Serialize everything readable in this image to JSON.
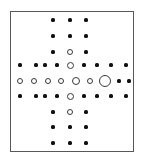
{
  "figure": {
    "title": "",
    "frame": {
      "x": 10,
      "y": 11,
      "width": 124,
      "height": 141,
      "border_color": "#555a5e"
    },
    "background_color": "#ffffff",
    "filled_marker_color": "#111111",
    "open_marker_edge_color": "#3a3a3a",
    "open_marker_fill_color": "#ffffff"
  },
  "chart_data": {
    "type": "scatter",
    "title": "",
    "xlabel": "",
    "ylabel": "",
    "grid": false,
    "legend": null,
    "axis_ticks_visible": false,
    "column_x": [
      20,
      36,
      53,
      70,
      86,
      98,
      114,
      128,
      128
    ],
    "grid_geometry": {
      "columns": 9,
      "rows": 9,
      "col_spacing_px": 16.5,
      "row_spacing_px": 16.0,
      "origin_x_px": 20,
      "origin_y_px": 20
    },
    "marker_sizes_px": {
      "filled_dot": 3.2,
      "open_small": 5.0,
      "open_medium": 7.0,
      "open_large": 8.0,
      "open_xlarge": 12.0
    },
    "points": [
      {
        "col": 3,
        "row": 0,
        "cx": 53,
        "cy": 20,
        "style": "filled",
        "d": 3.2
      },
      {
        "col": 4,
        "row": 0,
        "cx": 70,
        "cy": 20,
        "style": "filled",
        "d": 3.2
      },
      {
        "col": 5,
        "row": 0,
        "cx": 86,
        "cy": 20,
        "style": "filled",
        "d": 3.2
      },
      {
        "col": 3,
        "row": 1,
        "cx": 53,
        "cy": 36,
        "style": "filled",
        "d": 3.2
      },
      {
        "col": 4,
        "row": 1,
        "cx": 70,
        "cy": 36,
        "style": "filled",
        "d": 3.2
      },
      {
        "col": 5,
        "row": 1,
        "cx": 86,
        "cy": 36,
        "style": "filled",
        "d": 3.2
      },
      {
        "col": 3,
        "row": 2,
        "cx": 53,
        "cy": 52,
        "style": "filled",
        "d": 3.2
      },
      {
        "col": 4,
        "row": 2,
        "cx": 70,
        "cy": 52,
        "style": "open",
        "d": 6.0
      },
      {
        "col": 5,
        "row": 2,
        "cx": 86,
        "cy": 52,
        "style": "filled",
        "d": 3.2
      },
      {
        "col": 0,
        "row": 3,
        "cx": 20,
        "cy": 65,
        "style": "filled",
        "d": 3.2
      },
      {
        "col": 1,
        "row": 3,
        "cx": 36,
        "cy": 65,
        "style": "filled",
        "d": 3.2
      },
      {
        "col": 2,
        "row": 3,
        "cx": 45,
        "cy": 65,
        "style": "filled",
        "d": 3.2
      },
      {
        "col": 3,
        "row": 3,
        "cx": 57,
        "cy": 65,
        "style": "filled",
        "d": 3.2
      },
      {
        "col": 4,
        "row": 3,
        "cx": 70,
        "cy": 65,
        "style": "open",
        "d": 7.0
      },
      {
        "col": 5,
        "row": 3,
        "cx": 84,
        "cy": 65,
        "style": "filled",
        "d": 3.2
      },
      {
        "col": 6,
        "row": 3,
        "cx": 97,
        "cy": 65,
        "style": "filled",
        "d": 3.2
      },
      {
        "col": 7,
        "row": 3,
        "cx": 111,
        "cy": 65,
        "style": "filled",
        "d": 3.2
      },
      {
        "col": 8,
        "row": 3,
        "cx": 126,
        "cy": 65,
        "style": "filled",
        "d": 3.2
      },
      {
        "col": 0,
        "row": 4,
        "cx": 20,
        "cy": 81,
        "style": "open",
        "d": 6.0
      },
      {
        "col": 1,
        "row": 4,
        "cx": 34,
        "cy": 81,
        "style": "open",
        "d": 6.0
      },
      {
        "col": 2,
        "row": 4,
        "cx": 48,
        "cy": 81,
        "style": "open",
        "d": 6.0
      },
      {
        "col": 3,
        "row": 4,
        "cx": 61,
        "cy": 81,
        "style": "open",
        "d": 6.0
      },
      {
        "col": 4,
        "row": 4,
        "cx": 76,
        "cy": 81,
        "style": "open",
        "d": 8.0
      },
      {
        "col": 5,
        "row": 4,
        "cx": 90,
        "cy": 81,
        "style": "open",
        "d": 6.0
      },
      {
        "col": 6,
        "row": 4,
        "cx": 105,
        "cy": 81,
        "style": "open",
        "d": 12.0
      },
      {
        "col": 7,
        "row": 4,
        "cx": 119,
        "cy": 81,
        "style": "filled",
        "d": 3.2
      },
      {
        "col": 8,
        "row": 4,
        "cx": 129,
        "cy": 81,
        "style": "filled",
        "d": 3.2
      },
      {
        "col": 0,
        "row": 5,
        "cx": 20,
        "cy": 96,
        "style": "filled",
        "d": 3.2
      },
      {
        "col": 1,
        "row": 5,
        "cx": 36,
        "cy": 96,
        "style": "filled",
        "d": 3.2
      },
      {
        "col": 2,
        "row": 5,
        "cx": 45,
        "cy": 96,
        "style": "filled",
        "d": 3.2
      },
      {
        "col": 3,
        "row": 5,
        "cx": 57,
        "cy": 96,
        "style": "filled",
        "d": 3.2
      },
      {
        "col": 4,
        "row": 5,
        "cx": 70,
        "cy": 96,
        "style": "open",
        "d": 7.0
      },
      {
        "col": 5,
        "row": 5,
        "cx": 84,
        "cy": 96,
        "style": "filled",
        "d": 3.2
      },
      {
        "col": 6,
        "row": 5,
        "cx": 97,
        "cy": 96,
        "style": "filled",
        "d": 3.2
      },
      {
        "col": 7,
        "row": 5,
        "cx": 111,
        "cy": 96,
        "style": "filled",
        "d": 3.2
      },
      {
        "col": 8,
        "row": 5,
        "cx": 126,
        "cy": 96,
        "style": "filled",
        "d": 3.2
      },
      {
        "col": 3,
        "row": 6,
        "cx": 53,
        "cy": 112,
        "style": "filled",
        "d": 3.2
      },
      {
        "col": 4,
        "row": 6,
        "cx": 70,
        "cy": 112,
        "style": "open",
        "d": 6.0
      },
      {
        "col": 5,
        "row": 6,
        "cx": 86,
        "cy": 112,
        "style": "filled",
        "d": 3.2
      },
      {
        "col": 3,
        "row": 7,
        "cx": 53,
        "cy": 127,
        "style": "filled",
        "d": 3.2
      },
      {
        "col": 4,
        "row": 7,
        "cx": 70,
        "cy": 127,
        "style": "filled",
        "d": 3.2
      },
      {
        "col": 5,
        "row": 7,
        "cx": 86,
        "cy": 127,
        "style": "filled",
        "d": 3.2
      },
      {
        "col": 3,
        "row": 8,
        "cx": 53,
        "cy": 143,
        "style": "filled",
        "d": 3.2
      },
      {
        "col": 4,
        "row": 8,
        "cx": 70,
        "cy": 143,
        "style": "filled",
        "d": 3.2
      },
      {
        "col": 5,
        "row": 8,
        "cx": 86,
        "cy": 143,
        "style": "filled",
        "d": 3.2
      }
    ]
  }
}
